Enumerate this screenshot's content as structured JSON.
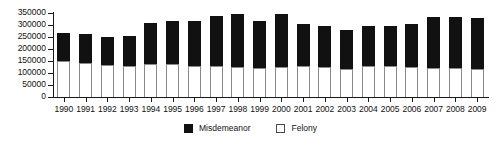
{
  "chart_data": {
    "type": "bar",
    "subtype": "stacked-bar",
    "title": "",
    "xlabel": "",
    "ylabel": "",
    "ylim": [
      0,
      350000
    ],
    "ytick_step": 50000,
    "yticks": [
      0,
      50000,
      100000,
      150000,
      200000,
      250000,
      300000,
      350000
    ],
    "ytick_labels": [
      "0",
      "50000",
      "100000",
      "150000",
      "200000",
      "250000",
      "300000",
      "350000"
    ],
    "grid": false,
    "legend_position": "bottom-center",
    "categories": [
      "1990",
      "1991",
      "1992",
      "1993",
      "1994",
      "1995",
      "1996",
      "1997",
      "1998",
      "1999",
      "2000",
      "2001",
      "2002",
      "2003",
      "2004",
      "2005",
      "2006",
      "2007",
      "2008",
      "2009"
    ],
    "series": [
      {
        "name": "Felony",
        "color": "#ffffff",
        "values": [
          150000,
          143000,
          132000,
          128000,
          138000,
          137000,
          131000,
          128000,
          126000,
          120000,
          125000,
          130000,
          127000,
          118000,
          130000,
          128000,
          124000,
          122000,
          122000,
          118000
        ]
      },
      {
        "name": "Misdemeanor",
        "color": "#111111",
        "values": [
          118000,
          118000,
          118000,
          128000,
          172000,
          181000,
          185000,
          210000,
          222000,
          198000,
          222000,
          173000,
          170000,
          162000,
          166000,
          168000,
          180000,
          211000,
          210000,
          213000
        ]
      }
    ],
    "totals": [
      268000,
      261000,
      250000,
      256000,
      310000,
      318000,
      316000,
      338000,
      348000,
      318000,
      347000,
      303000,
      297000,
      280000,
      296000,
      296000,
      304000,
      333000,
      332000,
      331000
    ]
  },
  "legend": {
    "items": [
      {
        "label": "Misdemeanor",
        "swatch": "filled-square-icon"
      },
      {
        "label": "Felony",
        "swatch": "hollow-square-icon"
      }
    ]
  }
}
